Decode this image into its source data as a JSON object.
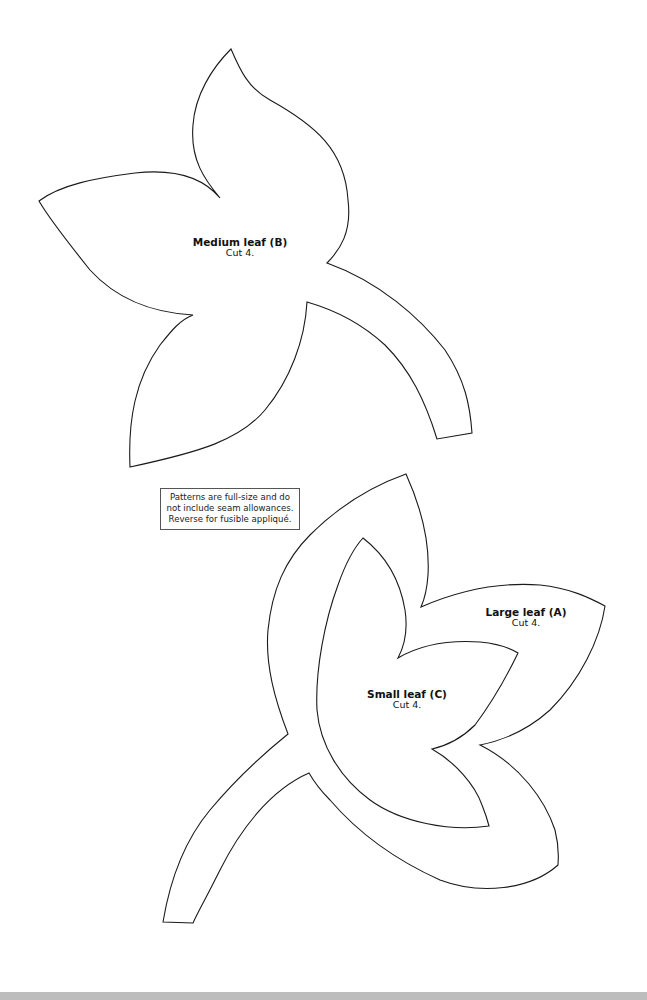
{
  "page": {
    "background": "#ffffff",
    "line_color": "#1a1a1a",
    "bottom_bar_color": "#bdbdbd"
  },
  "patterns": {
    "medium": {
      "title": "Medium leaf (B)",
      "instruction": "Cut 4."
    },
    "large": {
      "title": "Large leaf (A)",
      "instruction": "Cut 4."
    },
    "small": {
      "title": "Small leaf (C)",
      "instruction": "Cut 4."
    }
  },
  "note": {
    "lines": [
      "Patterns are full-size and do",
      "not include seam allowances.",
      "Reverse for fusible appliqué."
    ]
  }
}
